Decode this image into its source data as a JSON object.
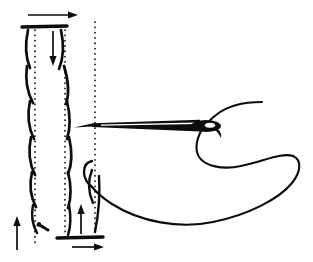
{
  "figure": {
    "width": 313,
    "height": 262,
    "background_color": "#ffffff",
    "ink_color": "#0d0d0d"
  },
  "fabric": {
    "label": "woven-fabric",
    "top_edge": {
      "label": "fabric-top-edge",
      "x1": 22,
      "y1": 27,
      "x2": 67,
      "y2": 26,
      "thickness": 3.4
    },
    "bottom_edge": {
      "label": "fabric-bottom-edge",
      "x1": 57,
      "y1": 238,
      "x2": 103,
      "y2": 237,
      "thickness": 3.4
    },
    "guides": [
      {
        "label": "guide-line-left",
        "x": 35,
        "y_top": 30,
        "y_bottom": 246
      },
      {
        "label": "guide-line-right",
        "x": 65,
        "y_top": 30,
        "y_bottom": 236
      },
      {
        "label": "guide-line-center",
        "x": 95,
        "y_top": 22,
        "y_bottom": 232
      }
    ],
    "weave_strokes_left": [
      {
        "d": "M 28 30 C 25 44 25 56 30 68",
        "w": 2.7
      },
      {
        "d": "M 27 66 C 25 80 27 92 33 103",
        "w": 2.7
      },
      {
        "d": "M 30 101 C 27 115 28 127 34 139",
        "w": 2.7
      },
      {
        "d": "M 31 137 C 28 151 29 163 35 175",
        "w": 2.7
      },
      {
        "d": "M 32 172 C 29 185 30 196 36 207",
        "w": 2.7
      },
      {
        "d": "M 33 205 C 31 215 32 224 37 233",
        "w": 2.5
      }
    ],
    "weave_strokes_right": [
      {
        "d": "M 61 30 C 64 44 64 57 59 69",
        "w": 2.7
      },
      {
        "d": "M 64 66 C 68 79 70 92 66 104",
        "w": 2.7
      },
      {
        "d": "M 67 101 C 70 114 71 127 67 139",
        "w": 2.7
      },
      {
        "d": "M 69 137 C 72 150 73 162 68 174",
        "w": 2.7
      },
      {
        "d": "M 68 172 C 71 184 72 196 68 208",
        "w": 2.7
      },
      {
        "d": "M 69 205 C 71 216 71 226 68 235",
        "w": 2.5
      }
    ],
    "weave_strokes_center": [
      {
        "d": "M 92 170 C 88 180 88 192 93 203",
        "w": 2.4
      },
      {
        "d": "M 99 176 C 100 192 99 212 95 232",
        "w": 2.4
      }
    ],
    "small_hook": {
      "label": "thread-tail-hook",
      "d": "M 38 225 C 42 225 45 229 48 230",
      "w": 3.0,
      "dot_x": 39,
      "dot_y": 224,
      "dot_r": 2.1
    }
  },
  "needle": {
    "label": "sewing-needle",
    "tip_x": 74,
    "eye_x": 206,
    "axis_y": 126,
    "eye": {
      "label": "needle-eye",
      "cx": 206,
      "cy": 126,
      "rx": 15,
      "ry": 6
    }
  },
  "thread": {
    "label": "sewing-thread",
    "upper_end_x": 262,
    "upper_end_y": 102,
    "loop_right_extent": 300,
    "lower_cross_x": 92,
    "lower_cross_y": 186
  },
  "arrows": [
    {
      "name": "arrow-top-right",
      "direction": "right",
      "label": "fabric shifts right at top",
      "x1": 28,
      "y1": 15,
      "x2": 78,
      "y2": 15
    },
    {
      "name": "arrow-top-down",
      "direction": "down",
      "label": "needle enters downward",
      "x1": 53,
      "y1": 31,
      "x2": 53,
      "y2": 66
    },
    {
      "name": "arrow-bottom-left-up",
      "direction": "up",
      "label": "fabric shifts up at left",
      "x1": 17,
      "y1": 250,
      "x2": 17,
      "y2": 216
    },
    {
      "name": "arrow-bottom-up",
      "direction": "up",
      "label": "needle exits upward",
      "x1": 81,
      "y1": 234,
      "x2": 81,
      "y2": 204
    },
    {
      "name": "arrow-bottom-right",
      "direction": "right",
      "label": "fabric shifts right at bottom",
      "x1": 72,
      "y1": 247,
      "x2": 104,
      "y2": 247
    }
  ]
}
